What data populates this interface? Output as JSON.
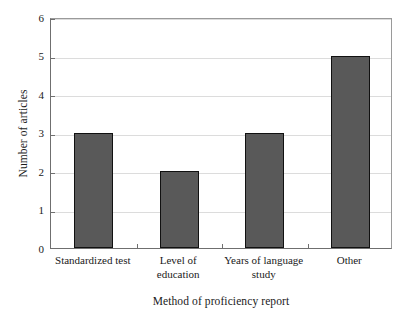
{
  "chart_data": {
    "type": "bar",
    "title": "",
    "subtitle": "",
    "xlabel": "Method of proficiency report",
    "ylabel": "Number of articles",
    "categories": [
      "Standardized test",
      "Level of\neducation",
      "Years of language\nstudy",
      "Other"
    ],
    "values": [
      3,
      2,
      3,
      5
    ],
    "ylim": [
      0,
      6
    ],
    "yticks": [
      0,
      1,
      2,
      3,
      4,
      5,
      6
    ],
    "ytick_labels": [
      "0",
      "1",
      "2",
      "3",
      "4",
      "5",
      "6"
    ],
    "grid": true,
    "grid_axis": "y",
    "legend": false,
    "legend_position": "none",
    "bar_fill_color": "#595959",
    "bar_edge_color": "#111111",
    "gridline_color": "#dcdcdc",
    "axis_color": "#6f6f6f",
    "frame_color": "#9a9a9a",
    "background_color": "#ffffff",
    "text_color": "#1a1a1a"
  }
}
